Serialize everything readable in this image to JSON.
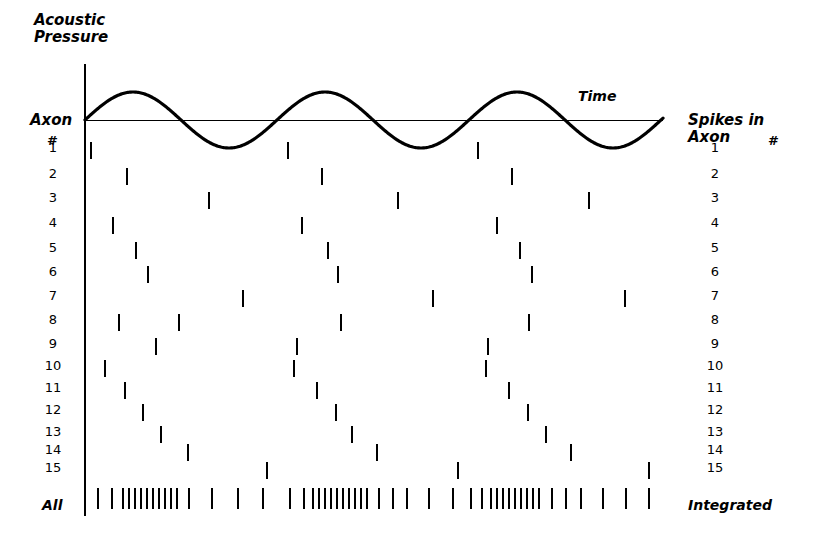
{
  "figure": {
    "title_acoustic": "Acoustic\nPressure",
    "time_label": "Time",
    "axon_label": "Axon",
    "hash_symbol": "#",
    "spikes_in_axon_label": "Spikes in\nAxon",
    "all_label": "All",
    "integrated_label": "Integrated",
    "axon_numbers": [
      "1",
      "2",
      "3",
      "4",
      "5",
      "6",
      "7",
      "8",
      "9",
      "10",
      "11",
      "12",
      "13",
      "14",
      "15"
    ],
    "colors": {
      "ink": "#000000",
      "background": "#ffffff"
    }
  },
  "chart_data": {
    "type": "scatter",
    "title": "Acoustic Pressure",
    "xlabel": "Time",
    "ylabel": "Axon #",
    "grid": false,
    "legend": "none",
    "stimulus": {
      "waveform": "sine",
      "cycles": 3,
      "baseline_y": 120,
      "amplitude_px": 28,
      "x_start": 85,
      "x_end": 663,
      "period_px": 192
    },
    "x_range": [
      85,
      663
    ],
    "row_y": {
      "1": 150,
      "2": 180,
      "3": 206,
      "4": 232,
      "5": 257,
      "6": 283,
      "7": 308,
      "8": 333,
      "9": 358,
      "10": 383,
      "11": 408,
      "12": 430,
      "13": 452,
      "14": 472,
      "15": 470,
      "all": 498
    },
    "series": [
      {
        "name": "Axon 1",
        "row": 1,
        "y": 150,
        "spikes": [
          90,
          287,
          477
        ]
      },
      {
        "name": "Axon 2",
        "row": 2,
        "y": 176,
        "spikes": [
          126,
          321,
          511
        ]
      },
      {
        "name": "Axon 3",
        "row": 3,
        "y": 200,
        "spikes": [
          208,
          397,
          588
        ]
      },
      {
        "name": "Axon 4",
        "row": 4,
        "y": 225,
        "spikes": [
          112,
          301,
          496
        ]
      },
      {
        "name": "Axon 5",
        "row": 5,
        "y": 250,
        "spikes": [
          135,
          327,
          519
        ]
      },
      {
        "name": "Axon 6",
        "row": 6,
        "y": 274,
        "spikes": [
          147,
          337,
          531
        ]
      },
      {
        "name": "Axon 7",
        "row": 7,
        "y": 298,
        "spikes": [
          242,
          432,
          624
        ]
      },
      {
        "name": "Axon 8",
        "row": 8,
        "y": 322,
        "spikes": [
          118,
          178,
          340,
          528
        ]
      },
      {
        "name": "Axon 9",
        "row": 9,
        "y": 346,
        "spikes": [
          155,
          296,
          487
        ]
      },
      {
        "name": "Axon 10",
        "row": 10,
        "y": 368,
        "spikes": [
          104,
          293,
          485
        ]
      },
      {
        "name": "Axon 11",
        "row": 11,
        "y": 390,
        "spikes": [
          124,
          316,
          508
        ]
      },
      {
        "name": "Axon 12",
        "row": 12,
        "y": 412,
        "spikes": [
          142,
          335,
          527
        ]
      },
      {
        "name": "Axon 13",
        "row": 13,
        "y": 434,
        "spikes": [
          160,
          351,
          545
        ]
      },
      {
        "name": "Axon 14",
        "row": 14,
        "y": 452,
        "spikes": [
          187,
          376,
          570
        ]
      },
      {
        "name": "Axon 15",
        "row": 15,
        "y": 470,
        "spikes": [
          266,
          457,
          648
        ]
      },
      {
        "name": "All (integrated)",
        "row": "all",
        "y": 498,
        "spikes": [
          97,
          111,
          122,
          128,
          134,
          140,
          146,
          152,
          158,
          164,
          170,
          176,
          188,
          211,
          237,
          262,
          289,
          303,
          312,
          318,
          324,
          330,
          336,
          342,
          348,
          354,
          360,
          366,
          378,
          392,
          406,
          428,
          452,
          470,
          481,
          490,
          496,
          502,
          508,
          514,
          520,
          526,
          532,
          538,
          551,
          565,
          580,
          602,
          625,
          648
        ]
      }
    ]
  }
}
